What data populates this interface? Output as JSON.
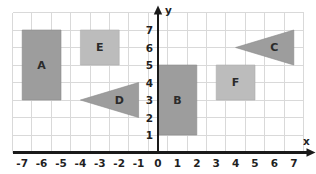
{
  "chart_data": {
    "type": "scatter",
    "title": "",
    "xlabel": "x",
    "ylabel": "y",
    "xlim": [
      -7.5,
      7.5
    ],
    "ylim": [
      0,
      8
    ],
    "grid": true,
    "legend": "none",
    "x_ticks": [
      "-7",
      "-6",
      "-5",
      "-4",
      "-3",
      "-2",
      "-1",
      "0",
      "1",
      "2",
      "3",
      "4",
      "5",
      "6",
      "7"
    ],
    "x_tick_values": [
      -7,
      -6,
      -5,
      -4,
      -3,
      -2,
      -1,
      0,
      1,
      2,
      3,
      4,
      5,
      6,
      7
    ],
    "y_ticks": [
      "1",
      "2",
      "3",
      "4",
      "5",
      "6",
      "7"
    ],
    "y_tick_values": [
      1,
      2,
      3,
      4,
      5,
      6,
      7
    ],
    "shapes": [
      {
        "label": "A",
        "kind": "rectangle",
        "shade": "dark",
        "x_min": -7,
        "x_max": -5,
        "y_min": 3,
        "y_max": 7,
        "label_x": -6,
        "label_y": 5,
        "points": [
          [
            -7,
            7
          ],
          [
            -5,
            7
          ],
          [
            -5,
            3
          ],
          [
            -7,
            3
          ]
        ]
      },
      {
        "label": "E",
        "kind": "rectangle",
        "shade": "light",
        "x_min": -4,
        "x_max": -2,
        "y_min": 5,
        "y_max": 7,
        "label_x": -3,
        "label_y": 6,
        "points": [
          [
            -4,
            7
          ],
          [
            -2,
            7
          ],
          [
            -2,
            5
          ],
          [
            -4,
            5
          ]
        ]
      },
      {
        "label": "D",
        "kind": "triangle",
        "shade": "dark",
        "label_x": -2,
        "label_y": 3,
        "points": [
          [
            -4,
            3
          ],
          [
            -1,
            4
          ],
          [
            -1,
            2
          ]
        ]
      },
      {
        "label": "B",
        "kind": "rectangle",
        "shade": "dark",
        "x_min": 0,
        "x_max": 2,
        "y_min": 1,
        "y_max": 5,
        "label_x": 1,
        "label_y": 3,
        "points": [
          [
            0,
            5
          ],
          [
            2,
            5
          ],
          [
            2,
            1
          ],
          [
            0,
            1
          ]
        ]
      },
      {
        "label": "F",
        "kind": "rectangle",
        "shade": "light",
        "x_min": 3,
        "x_max": 5,
        "y_min": 3,
        "y_max": 5,
        "label_x": 4,
        "label_y": 4,
        "points": [
          [
            3,
            5
          ],
          [
            5,
            5
          ],
          [
            5,
            3
          ],
          [
            3,
            3
          ]
        ]
      },
      {
        "label": "C",
        "kind": "triangle",
        "shade": "dark",
        "label_x": 6,
        "label_y": 6,
        "points": [
          [
            4,
            6
          ],
          [
            7,
            7
          ],
          [
            7,
            5
          ]
        ]
      }
    ],
    "colors": {
      "shape_dark": "#9d9d9d",
      "shape_light": "#bcbcbc",
      "grid": "#d9d9d9",
      "axis": "#1a1a1a",
      "background": "#ffffff"
    }
  }
}
